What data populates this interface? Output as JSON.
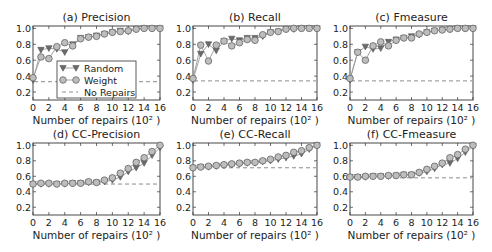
{
  "figure": {
    "legend": {
      "random_label": "Random",
      "weight_label": "Weight",
      "baseline_label": "No Repairs"
    },
    "colors": {
      "random": "#6a6a6a",
      "weight": "#8a8a8a",
      "baseline": "#8c8c8c",
      "line": "#9a9a9a",
      "axes": "#333333"
    }
  },
  "chart_data": [
    {
      "id": "a",
      "type": "line",
      "title": "(a) Precision",
      "xlabel": "Number of repairs (10² )",
      "ylabel": "",
      "xlim": [
        0,
        16
      ],
      "ylim": [
        0.1,
        1.03
      ],
      "xticks": [
        0,
        2,
        4,
        6,
        8,
        10,
        12,
        14,
        16
      ],
      "yticks": [
        0.2,
        0.4,
        0.6,
        0.8,
        1.0
      ],
      "ytick_labels": [
        "0.2",
        "0.4",
        "0.6",
        "0.8",
        "1.0"
      ],
      "legend_position": "lower center",
      "x": [
        0,
        1,
        2,
        3,
        4,
        5,
        6,
        7,
        8,
        9,
        10,
        11,
        12,
        13,
        14,
        15,
        16
      ],
      "series": [
        {
          "name": "Random",
          "marker": "triangle-down",
          "values": [
            0.35,
            0.73,
            0.75,
            0.74,
            0.7,
            0.8,
            0.88,
            0.89,
            0.91,
            0.93,
            0.95,
            0.97,
            0.96,
            0.99,
            1.0,
            1.0,
            1.0
          ]
        },
        {
          "name": "Weight",
          "marker": "circle",
          "values": [
            0.38,
            0.64,
            0.62,
            0.77,
            0.82,
            0.78,
            0.87,
            0.89,
            0.9,
            0.93,
            0.95,
            0.96,
            0.97,
            0.99,
            1.0,
            1.0,
            1.0
          ]
        },
        {
          "name": "No Repairs",
          "marker": "none",
          "style": "dashed",
          "values": [
            0.33,
            0.33,
            0.33,
            0.33,
            0.33,
            0.33,
            0.33,
            0.33,
            0.33,
            0.33,
            0.33,
            0.33,
            0.33,
            0.33,
            0.33,
            0.33,
            0.33
          ]
        }
      ]
    },
    {
      "id": "b",
      "type": "line",
      "title": "(b) Recall",
      "xlabel": "Number of repairs (10² )",
      "ylabel": "",
      "xlim": [
        0,
        16
      ],
      "ylim": [
        0.1,
        1.03
      ],
      "xticks": [
        0,
        2,
        4,
        6,
        8,
        10,
        12,
        14,
        16
      ],
      "yticks": [
        0.2,
        0.4,
        0.6,
        0.8,
        1.0
      ],
      "ytick_labels": [
        "0.2",
        "0.4",
        "0.6",
        "0.8",
        "1.0"
      ],
      "x": [
        0,
        1,
        2,
        3,
        4,
        5,
        6,
        7,
        8,
        9,
        10,
        11,
        12,
        13,
        14,
        15,
        16
      ],
      "series": [
        {
          "name": "Random",
          "marker": "triangle-down",
          "values": [
            0.35,
            0.68,
            0.8,
            0.72,
            0.84,
            0.87,
            0.85,
            0.88,
            0.88,
            0.9,
            0.95,
            0.96,
            0.99,
            0.99,
            1.0,
            1.0,
            1.0
          ]
        },
        {
          "name": "Weight",
          "marker": "circle",
          "values": [
            0.37,
            0.79,
            0.59,
            0.79,
            0.84,
            0.78,
            0.82,
            0.86,
            0.85,
            0.92,
            0.95,
            0.96,
            0.99,
            1.0,
            1.0,
            1.0,
            1.0
          ]
        },
        {
          "name": "No Repairs",
          "marker": "none",
          "style": "dashed",
          "values": [
            0.34,
            0.34,
            0.34,
            0.34,
            0.34,
            0.34,
            0.34,
            0.34,
            0.34,
            0.34,
            0.34,
            0.34,
            0.34,
            0.34,
            0.34,
            0.34,
            0.34
          ]
        }
      ]
    },
    {
      "id": "c",
      "type": "line",
      "title": "(c) Fmeasure",
      "xlabel": "Number of repairs (10² )",
      "ylabel": "",
      "xlim": [
        0,
        16
      ],
      "ylim": [
        0.1,
        1.03
      ],
      "xticks": [
        0,
        2,
        4,
        6,
        8,
        10,
        12,
        14,
        16
      ],
      "yticks": [
        0.2,
        0.4,
        0.6,
        0.8,
        1.0
      ],
      "ytick_labels": [
        "0.2",
        "0.4",
        "0.6",
        "0.8",
        "1.0"
      ],
      "x": [
        0,
        1,
        2,
        3,
        4,
        5,
        6,
        7,
        8,
        9,
        10,
        11,
        12,
        13,
        14,
        15,
        16
      ],
      "series": [
        {
          "name": "Random",
          "marker": "triangle-down",
          "values": [
            0.35,
            0.7,
            0.77,
            0.74,
            0.75,
            0.83,
            0.86,
            0.88,
            0.9,
            0.92,
            0.95,
            0.97,
            0.98,
            0.99,
            1.0,
            1.0,
            1.0
          ]
        },
        {
          "name": "Weight",
          "marker": "circle",
          "values": [
            0.37,
            0.7,
            0.6,
            0.78,
            0.83,
            0.78,
            0.85,
            0.88,
            0.88,
            0.93,
            0.95,
            0.97,
            0.98,
            0.99,
            1.0,
            1.0,
            1.0
          ]
        },
        {
          "name": "No Repairs",
          "marker": "none",
          "style": "dashed",
          "values": [
            0.34,
            0.34,
            0.34,
            0.34,
            0.34,
            0.34,
            0.34,
            0.34,
            0.34,
            0.34,
            0.34,
            0.34,
            0.34,
            0.34,
            0.34,
            0.34,
            0.34
          ]
        }
      ]
    },
    {
      "id": "d",
      "type": "line",
      "title": "(d) CC-Precision",
      "xlabel": "Number of repairs (10² )",
      "ylabel": "",
      "xlim": [
        0,
        16
      ],
      "ylim": [
        0.1,
        1.03
      ],
      "xticks": [
        0,
        2,
        4,
        6,
        8,
        10,
        12,
        14,
        16
      ],
      "yticks": [
        0.2,
        0.4,
        0.6,
        0.8,
        1.0
      ],
      "ytick_labels": [
        "0.2",
        "0.4",
        "0.6",
        "0.8",
        "1.0"
      ],
      "x": [
        0,
        1,
        2,
        3,
        4,
        5,
        6,
        7,
        8,
        9,
        10,
        11,
        12,
        13,
        14,
        15,
        16
      ],
      "series": [
        {
          "name": "Random",
          "marker": "triangle-down",
          "values": [
            0.5,
            0.5,
            0.5,
            0.5,
            0.5,
            0.51,
            0.51,
            0.52,
            0.52,
            0.53,
            0.55,
            0.59,
            0.66,
            0.71,
            0.77,
            0.87,
            0.97
          ]
        },
        {
          "name": "Weight",
          "marker": "circle",
          "values": [
            0.5,
            0.51,
            0.51,
            0.5,
            0.51,
            0.51,
            0.51,
            0.53,
            0.52,
            0.55,
            0.58,
            0.64,
            0.7,
            0.78,
            0.84,
            0.92,
            1.0
          ]
        },
        {
          "name": "No Repairs",
          "marker": "none",
          "style": "dashed",
          "values": [
            0.5,
            0.5,
            0.5,
            0.5,
            0.5,
            0.5,
            0.5,
            0.5,
            0.5,
            0.5,
            0.5,
            0.5,
            0.5,
            0.5,
            0.5,
            0.5,
            0.5
          ]
        }
      ]
    },
    {
      "id": "e",
      "type": "line",
      "title": "(e) CC-Recall",
      "xlabel": "Number of repairs (10² )",
      "ylabel": "",
      "xlim": [
        0,
        16
      ],
      "ylim": [
        0.1,
        1.03
      ],
      "xticks": [
        0,
        2,
        4,
        6,
        8,
        10,
        12,
        14,
        16
      ],
      "yticks": [
        0.2,
        0.4,
        0.6,
        0.8,
        1.0
      ],
      "ytick_labels": [
        "0.2",
        "0.4",
        "0.6",
        "0.8",
        "1.0"
      ],
      "x": [
        0,
        1,
        2,
        3,
        4,
        5,
        6,
        7,
        8,
        9,
        10,
        11,
        12,
        13,
        14,
        15,
        16
      ],
      "series": [
        {
          "name": "Random",
          "marker": "triangle-down",
          "values": [
            0.71,
            0.72,
            0.72,
            0.73,
            0.74,
            0.75,
            0.76,
            0.77,
            0.77,
            0.79,
            0.8,
            0.82,
            0.84,
            0.86,
            0.89,
            0.95,
            1.0
          ]
        },
        {
          "name": "Weight",
          "marker": "circle",
          "values": [
            0.71,
            0.72,
            0.73,
            0.74,
            0.75,
            0.76,
            0.77,
            0.78,
            0.78,
            0.8,
            0.82,
            0.85,
            0.87,
            0.91,
            0.93,
            0.97,
            1.0
          ]
        },
        {
          "name": "No Repairs",
          "marker": "none",
          "style": "dashed",
          "values": [
            0.71,
            0.71,
            0.71,
            0.71,
            0.71,
            0.71,
            0.71,
            0.71,
            0.71,
            0.71,
            0.71,
            0.71,
            0.71,
            0.71,
            0.71,
            0.71,
            0.71
          ]
        }
      ]
    },
    {
      "id": "f",
      "type": "line",
      "title": "(f) CC-Fmeasure",
      "xlabel": "Number of repairs (10² )",
      "ylabel": "",
      "xlim": [
        0,
        16
      ],
      "ylim": [
        0.1,
        1.03
      ],
      "xticks": [
        0,
        2,
        4,
        6,
        8,
        10,
        12,
        14,
        16
      ],
      "yticks": [
        0.2,
        0.4,
        0.6,
        0.8,
        1.0
      ],
      "ytick_labels": [
        "0.2",
        "0.4",
        "0.6",
        "0.8",
        "1.0"
      ],
      "x": [
        0,
        1,
        2,
        3,
        4,
        5,
        6,
        7,
        8,
        9,
        10,
        11,
        12,
        13,
        14,
        15,
        16
      ],
      "series": [
        {
          "name": "Random",
          "marker": "triangle-down",
          "values": [
            0.59,
            0.59,
            0.59,
            0.6,
            0.6,
            0.6,
            0.61,
            0.62,
            0.62,
            0.64,
            0.66,
            0.7,
            0.75,
            0.77,
            0.83,
            0.91,
            0.99
          ]
        },
        {
          "name": "Weight",
          "marker": "circle",
          "values": [
            0.59,
            0.59,
            0.6,
            0.6,
            0.6,
            0.61,
            0.61,
            0.62,
            0.62,
            0.65,
            0.69,
            0.73,
            0.77,
            0.84,
            0.88,
            0.95,
            1.0
          ]
        },
        {
          "name": "No Repairs",
          "marker": "none",
          "style": "dashed",
          "values": [
            0.58,
            0.58,
            0.58,
            0.58,
            0.58,
            0.58,
            0.58,
            0.58,
            0.58,
            0.58,
            0.58,
            0.58,
            0.58,
            0.58,
            0.58,
            0.58,
            0.58
          ]
        }
      ]
    }
  ]
}
